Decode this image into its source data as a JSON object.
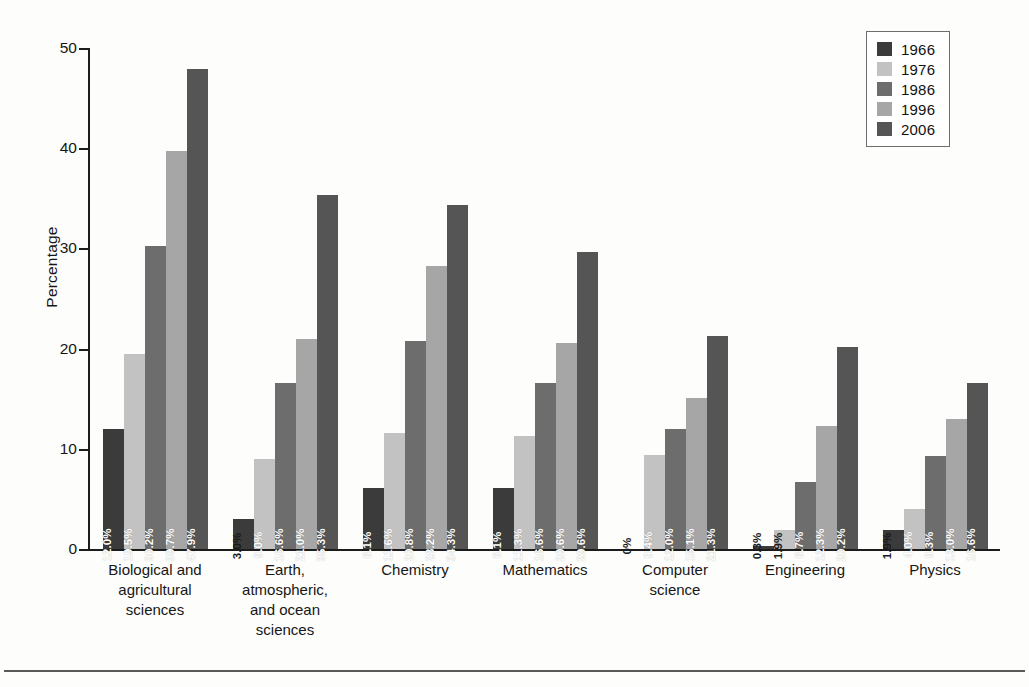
{
  "chart_data": {
    "type": "bar",
    "title": "",
    "subtitle": "",
    "xlabel": "",
    "ylabel": "Percentage",
    "ylim": [
      0,
      50
    ],
    "yticks": [
      0,
      10,
      20,
      30,
      40,
      50
    ],
    "ytick_labels": [
      "0",
      "10",
      "20",
      "30",
      "40",
      "50"
    ],
    "grid": false,
    "legend_position": "top-right",
    "legend_title": "",
    "value_label_suffix": "%",
    "categories": [
      "Biological and agricultural sciences",
      "Earth, atmospheric, and ocean sciences",
      "Chemistry",
      "Mathematics",
      "Computer science",
      "Engineering",
      "Physics"
    ],
    "category_lines": [
      [
        "Biological and",
        "agricultural",
        "sciences"
      ],
      [
        "Earth,",
        "atmospheric,",
        "and ocean",
        "sciences"
      ],
      [
        "Chemistry"
      ],
      [
        "Mathematics"
      ],
      [
        "Computer",
        "science"
      ],
      [
        "Engineering"
      ],
      [
        "Physics"
      ]
    ],
    "series": [
      {
        "name": "1966",
        "color": "#3b3b3b",
        "values": [
          12.0,
          3.0,
          6.1,
          6.1,
          0,
          0.3,
          1.9
        ],
        "labels": [
          "12.0%",
          "3.0%",
          "6.1%",
          "6.1%",
          "0%",
          "0.3%",
          "1.9%"
        ]
      },
      {
        "name": "1976",
        "color": "#c2c2c2",
        "values": [
          19.5,
          9.0,
          11.6,
          11.3,
          9.4,
          1.9,
          4.0
        ],
        "labels": [
          "19.5%",
          "9.0%",
          "11.6%",
          "11.3%",
          "9.4%",
          "1.9%",
          "4.0%"
        ]
      },
      {
        "name": "1986",
        "color": "#6d6d6d",
        "values": [
          30.2,
          16.6,
          20.8,
          16.6,
          12.0,
          6.7,
          9.3
        ],
        "labels": [
          "30.2%",
          "16.6%",
          "20.8%",
          "16.6%",
          "12.0%",
          "6.7%",
          "9.3%"
        ]
      },
      {
        "name": "1996",
        "color": "#a6a6a6",
        "values": [
          39.7,
          21.0,
          28.2,
          20.6,
          15.1,
          12.3,
          13.0
        ],
        "labels": [
          "39.7%",
          "21.0%",
          "28.2%",
          "20.6%",
          "15.1%",
          "12.3%",
          "13.0%"
        ]
      },
      {
        "name": "2006",
        "color": "#555555",
        "values": [
          47.9,
          35.3,
          34.3,
          29.6,
          21.3,
          20.2,
          16.6
        ],
        "labels": [
          "47.9%",
          "35.3%",
          "34.3%",
          "29.6%",
          "21.3%",
          "20.2%",
          "16.6%"
        ]
      }
    ]
  }
}
